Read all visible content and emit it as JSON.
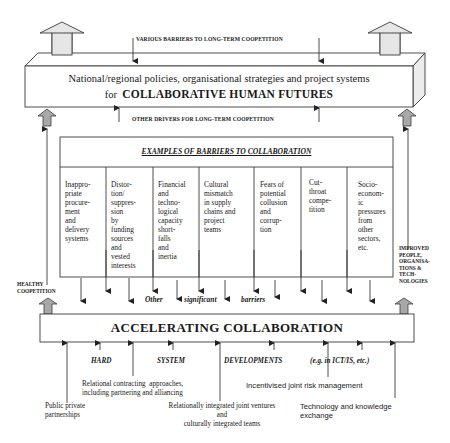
{
  "colors": {
    "line": "#3a3a3a",
    "big_arrow_fill": "#e6e6e6",
    "small_arrow_fill": "#a8a8a8",
    "box_fill": "#ffffff",
    "side_face_fill": "#ececec"
  },
  "top_box": {
    "barriers_label": "VARIOUS BARRIERS TO LONG-TERM COOPETITION",
    "line1": "National/regional policies, organisational strategies and project systems",
    "line2_prefix": "for",
    "line2_bold": "COLLABORATIVE HUMAN FUTURES",
    "drivers_label": "OTHER  DRIVERS FOR  LONG-TERM COOPETITION"
  },
  "barriers_box": {
    "title": "EXAMPLES OF BARRIERS TO COLLABORATION",
    "columns": [
      {
        "text": "Inappro-\npriate\nprocure-\nment\nand\ndelivery\nsystems"
      },
      {
        "text": "Distor-\ntion/\nsuppres-\nsion\nby\nfunding\nsources\nand\nvested\ninterests"
      },
      {
        "text": "Financial\nand\ntechno-\nlogical\ncapacity\nshort-\nfalls\nand\ninertia"
      },
      {
        "text": "Cultural\nmismatch\nin supply\nchains and\nproject\nteams"
      },
      {
        "text": "Fears of\npotential\ncollusion\nand\ncorrup-\ntion"
      },
      {
        "text": "Cut-\nthroat\ncompe-\ntition"
      },
      {
        "text": "Socio-\neconom-\nic\npressures\nfrom\nother\nsectors,\netc."
      }
    ]
  },
  "side_labels": {
    "left": "HEALTHY\nCOOPETITION",
    "right": "IMPROVED\nPEOPLE,\nORGANISA-\nTIONS &\nTECH-\nNOLOGIES"
  },
  "middle_words": {
    "w1": "Other",
    "w2": "significant",
    "w3": "barriers"
  },
  "accelerating_box": {
    "label": "ACCELERATING COLLABORATION"
  },
  "developments": {
    "w1": "HARD",
    "w2": "SYSTEM",
    "w3": "DEVELOPMENTS",
    "w4": "(e.g. in ICT/IS, etc.)"
  },
  "drivers": {
    "ppp": "Public private\npartnerships",
    "relational_contracting": "Relational contracting  approaches,\nincluding partnering and alliancing",
    "joint_ventures": "Relationally integrated joint ventures\nand\nculturally integrated teams",
    "risk": "Incentivised joint risk management",
    "tech": "Technology and knowledge\nexchange"
  }
}
